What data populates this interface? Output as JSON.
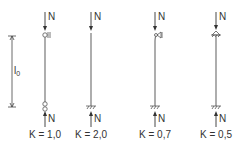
{
  "diagram": {
    "length_label": "l",
    "length_subscript": "0",
    "load_label": "N",
    "columns": [
      {
        "id": "pinned-pinned",
        "k_label": "K = 1,0",
        "top": "roller-hinge",
        "bottom": "hinge"
      },
      {
        "id": "fixed-free",
        "k_label": "K = 2,0",
        "top": "free",
        "bottom": "fixed"
      },
      {
        "id": "fixed-pinned",
        "k_label": "K = 0,7",
        "top": "roller-hinge",
        "bottom": "fixed"
      },
      {
        "id": "fixed-fixed",
        "k_label": "K = 0,5",
        "top": "fixed",
        "bottom": "fixed"
      }
    ]
  }
}
